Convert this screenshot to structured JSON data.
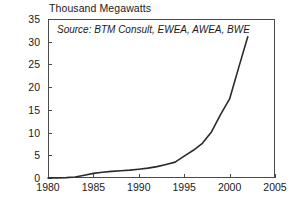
{
  "chart_data": {
    "type": "line",
    "title": "Thousand Megawatts",
    "subtitle": "",
    "annotation": "Source: BTM Consult, EWEA, AWEA, BWE",
    "xlabel": "",
    "ylabel": "Thousand Megawatts",
    "xlim": [
      1980,
      2005
    ],
    "ylim": [
      0,
      35
    ],
    "grid": false,
    "legend": false,
    "xticks": [
      1980,
      1985,
      1990,
      1995,
      2000,
      2005
    ],
    "yticks": [
      0,
      5,
      10,
      15,
      20,
      25,
      30,
      35
    ],
    "line_color": "#2b2b2b",
    "x": [
      1980,
      1981,
      1982,
      1983,
      1984,
      1985,
      1986,
      1987,
      1988,
      1989,
      1990,
      1991,
      1992,
      1993,
      1994,
      1995,
      1996,
      1997,
      1998,
      1999,
      2000,
      2001,
      2002
    ],
    "values": [
      0.01,
      0.03,
      0.09,
      0.21,
      0.6,
      1.02,
      1.27,
      1.45,
      1.58,
      1.73,
      1.93,
      2.17,
      2.51,
      2.99,
      3.49,
      4.82,
      6.1,
      7.64,
      10.15,
      13.93,
      17.4,
      24.3,
      31.1
    ],
    "series": [
      {
        "name": "World Wind Electric Generating Capacity",
        "values": [
          0.01,
          0.03,
          0.09,
          0.21,
          0.6,
          1.02,
          1.27,
          1.45,
          1.58,
          1.73,
          1.93,
          2.17,
          2.51,
          2.99,
          3.49,
          4.82,
          6.1,
          7.64,
          10.15,
          13.93,
          17.4,
          24.3,
          31.1
        ]
      }
    ]
  }
}
